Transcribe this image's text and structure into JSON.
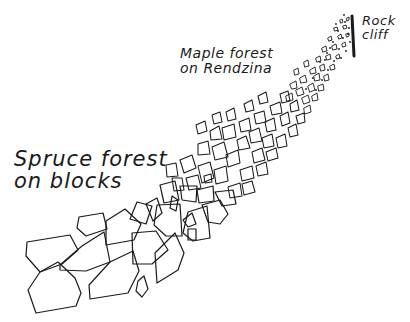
{
  "diagram": {
    "type": "hand-drawn-landscape-profile",
    "labels": {
      "rock_cliff": "Rock\ncliff",
      "maple_forest": "Maple forest\non Rendzina",
      "spruce_forest": "Spruce forest\non blocks"
    },
    "colors": {
      "ink": "#1a1a1a",
      "background": "#ffffff"
    }
  }
}
